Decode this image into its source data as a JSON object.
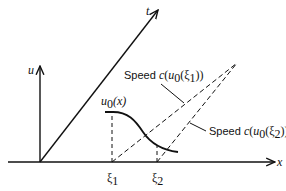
{
  "diagram": {
    "axes": {
      "x_label": "x",
      "u_label": "u",
      "t_label": "t"
    },
    "curve_label": {
      "func": "u",
      "sub": "0",
      "arg": "(x)"
    },
    "ticks": [
      {
        "base": "ξ",
        "sub": "1"
      },
      {
        "base": "ξ",
        "sub": "2"
      }
    ],
    "annotations": [
      {
        "prefix": "Speed ",
        "c": "c",
        "open": "(",
        "u": "u",
        "u_sub": "0",
        "xi_open": "(ξ",
        "xi_sub": "1",
        "close": "))"
      },
      {
        "prefix": "Speed ",
        "c": "c",
        "open": "(",
        "u": "u",
        "u_sub": "0",
        "xi_open": "(ξ",
        "xi_sub": "2",
        "close": "))"
      }
    ],
    "colors": {
      "ink": "#111111",
      "background": "#ffffff"
    }
  }
}
